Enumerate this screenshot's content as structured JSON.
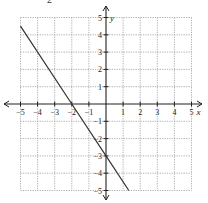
{
  "header": {
    "fragment_text": "2"
  },
  "chart_data": {
    "type": "line",
    "title": "",
    "xlabel": "x",
    "ylabel": "y",
    "xlim": [
      -5,
      5
    ],
    "ylim": [
      -5,
      5
    ],
    "grid": true,
    "x_ticks": [
      -5,
      -4,
      -3,
      -2,
      -1,
      1,
      2,
      3,
      4,
      5
    ],
    "y_ticks": [
      5,
      4,
      3,
      2,
      1,
      -1,
      -2,
      -3,
      -4,
      -5
    ],
    "series": [
      {
        "name": "line",
        "equation": "y = -1.5x - 3",
        "slope": -1.5,
        "intercept": -3,
        "x": [
          -5,
          -2,
          0,
          1.333
        ],
        "y": [
          4.5,
          0,
          -3,
          -5
        ]
      }
    ],
    "colors": {
      "line": "#333333",
      "grid": "#999999",
      "axis": "#222222"
    }
  }
}
